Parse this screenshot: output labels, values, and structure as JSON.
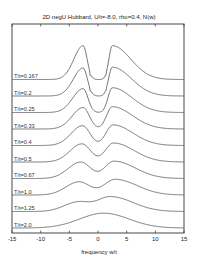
{
  "chart_data": {
    "type": "line",
    "title": "2D negU Hubbard, U/t=-8.0, rho=0.4, N(w)",
    "xlabel": "frequency w/t",
    "ylabel": "",
    "xlim": [
      -15,
      15
    ],
    "xticks": [
      -15,
      -10,
      -5,
      0,
      5,
      10,
      15
    ],
    "xtick_labels": [
      "-15",
      "-10",
      "-5",
      "0",
      "5",
      "10",
      "15"
    ],
    "yticks_visible": false,
    "grid": false,
    "offset_per_curve": 1.0,
    "y_units": "arbitrary (curves vertically offset, waterfall plot)",
    "series": [
      {
        "name": "T/t=0.167",
        "label": "T/t=0.167",
        "offset": 9,
        "peaks": [
          {
            "center": -2.6,
            "width_left": 1.6,
            "width_right": 0.7,
            "height": 2.05
          },
          {
            "center": 2.5,
            "width_left": 0.6,
            "width_right": 3.2,
            "height": 2.05
          }
        ],
        "gap": [
          -1.5,
          1.5
        ],
        "gap_floor": 0.25
      },
      {
        "name": "T/t=0.2",
        "label": "T/t=0.2",
        "offset": 8,
        "peaks": [
          {
            "center": -2.6,
            "width_left": 1.7,
            "width_right": 0.75,
            "height": 1.7
          },
          {
            "center": 2.5,
            "width_left": 0.65,
            "width_right": 3.3,
            "height": 1.75
          }
        ],
        "gap": [
          -1.5,
          1.5
        ],
        "gap_floor": 0.3
      },
      {
        "name": "T/t=0.25",
        "label": "T/t=0.25",
        "offset": 7,
        "peaks": [
          {
            "center": -2.6,
            "width_left": 1.8,
            "width_right": 0.85,
            "height": 1.45
          },
          {
            "center": 2.5,
            "width_left": 0.75,
            "width_right": 3.4,
            "height": 1.5
          }
        ],
        "gap": [
          -1.3,
          1.3
        ],
        "gap_floor": 0.4
      },
      {
        "name": "T/t=0.33",
        "label": "T/t=0.33",
        "offset": 6,
        "peaks": [
          {
            "center": -2.6,
            "width_left": 1.9,
            "width_right": 1.1,
            "height": 1.3
          },
          {
            "center": 2.5,
            "width_left": 1.0,
            "width_right": 3.5,
            "height": 1.35
          }
        ],
        "gap": [
          -1.0,
          1.0
        ],
        "gap_floor": 0.55
      },
      {
        "name": "T/t=0.4",
        "label": "T/t=0.4",
        "offset": 5,
        "peaks": [
          {
            "center": -2.7,
            "width_left": 2.0,
            "width_right": 1.3,
            "height": 1.2
          },
          {
            "center": 2.6,
            "width_left": 1.2,
            "width_right": 3.5,
            "height": 1.25
          }
        ],
        "gap": [
          -0.5,
          0.5
        ],
        "gap_floor": 0.6
      },
      {
        "name": "T/t=0.5",
        "label": "T/t=0.5",
        "offset": 4,
        "peaks": [
          {
            "center": -2.8,
            "width_left": 2.1,
            "width_right": 1.5,
            "height": 1.1
          },
          {
            "center": 2.7,
            "width_left": 1.4,
            "width_right": 3.6,
            "height": 1.15
          }
        ],
        "gap": [
          0,
          0
        ],
        "gap_floor": 0.65
      },
      {
        "name": "T/t=0.67",
        "label": "T/t=0.67",
        "offset": 3,
        "peaks": [
          {
            "center": -3.0,
            "width_left": 2.2,
            "width_right": 1.7,
            "height": 1.0
          },
          {
            "center": 2.8,
            "width_left": 1.6,
            "width_right": 3.7,
            "height": 1.05
          }
        ],
        "gap": [
          0,
          0
        ],
        "gap_floor": 0.7
      },
      {
        "name": "T/t=1.0",
        "label": "T/t=1.0",
        "offset": 2,
        "peaks": [
          {
            "center": -3.3,
            "width_left": 2.3,
            "width_right": 1.9,
            "height": 0.8
          },
          {
            "center": 3.0,
            "width_left": 1.9,
            "width_right": 3.8,
            "height": 0.95
          }
        ],
        "gap": [
          0,
          0
        ],
        "gap_floor": 0.7
      },
      {
        "name": "T/t=1.25",
        "label": "T/t=1.25",
        "offset": 1,
        "peaks": [
          {
            "center": -3.6,
            "width_left": 2.4,
            "width_right": 2.0,
            "height": 0.55
          },
          {
            "center": 2.2,
            "width_left": 2.4,
            "width_right": 3.9,
            "height": 0.9
          }
        ],
        "gap": [
          0,
          0
        ],
        "gap_floor": 0.7
      },
      {
        "name": "T/t=2.0",
        "label": "T/t=2.0",
        "offset": 0,
        "peaks": [
          {
            "center": 1.0,
            "width_left": 4.2,
            "width_right": 4.4,
            "height": 0.9
          }
        ],
        "gap": [
          0,
          0
        ],
        "gap_floor": 0.9
      }
    ],
    "legend": "inline labels at left of each curve"
  }
}
